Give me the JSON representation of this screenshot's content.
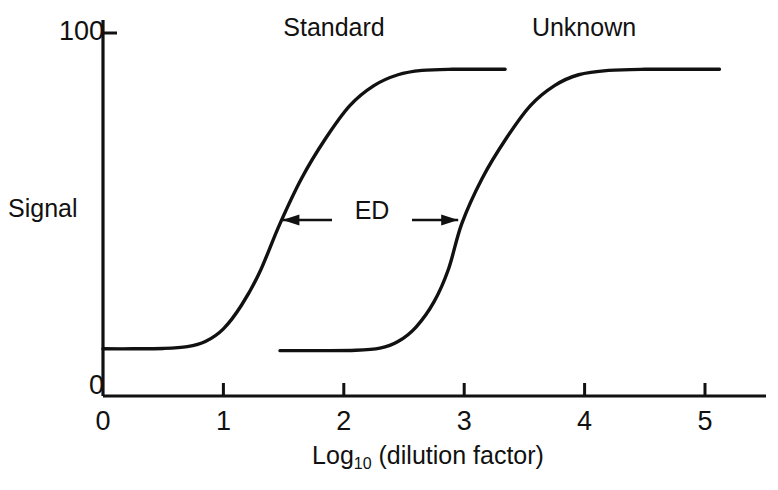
{
  "chart_data": {
    "type": "line",
    "title": "",
    "xlabel": "Log10 (dilution factor)",
    "xlabel_base": "Log",
    "xlabel_sub": "10",
    "xlabel_rest": " (dilution factor)",
    "ylabel": "Signal",
    "xlim": [
      0,
      5
    ],
    "ylim": [
      0,
      100
    ],
    "xticks": [
      0,
      1,
      2,
      3,
      4,
      5
    ],
    "xtick_labels": [
      "0",
      "1",
      "2",
      "3",
      "4",
      "5"
    ],
    "yticks": [
      0,
      100
    ],
    "ytick_labels": [
      "0",
      "100"
    ],
    "grid": false,
    "legend": "inline-labels",
    "series": [
      {
        "name": "Standard",
        "label_x": 2.0,
        "label_y": 96,
        "bottom_plateau": 13,
        "top_plateau": 90,
        "midpoint_x": 1.47,
        "x_start": 0.0,
        "x_end": 3.34,
        "points": [
          {
            "x": 0.0,
            "y": 13.0
          },
          {
            "x": 0.25,
            "y": 13.0
          },
          {
            "x": 0.5,
            "y": 13.1
          },
          {
            "x": 0.7,
            "y": 13.6
          },
          {
            "x": 0.85,
            "y": 15.0
          },
          {
            "x": 1.0,
            "y": 18.5
          },
          {
            "x": 1.15,
            "y": 25.0
          },
          {
            "x": 1.3,
            "y": 34.0
          },
          {
            "x": 1.47,
            "y": 47.5
          },
          {
            "x": 1.65,
            "y": 60.0
          },
          {
            "x": 1.85,
            "y": 71.0
          },
          {
            "x": 2.05,
            "y": 80.0
          },
          {
            "x": 2.25,
            "y": 85.5
          },
          {
            "x": 2.45,
            "y": 88.5
          },
          {
            "x": 2.65,
            "y": 89.7
          },
          {
            "x": 2.9,
            "y": 90.0
          },
          {
            "x": 3.34,
            "y": 90.0
          }
        ]
      },
      {
        "name": "Unknown",
        "label_x": 3.55,
        "label_y": 96,
        "bottom_plateau": 12.5,
        "top_plateau": 90,
        "midpoint_x": 2.98,
        "x_start": 1.47,
        "x_end": 5.12,
        "points": [
          {
            "x": 1.47,
            "y": 12.5
          },
          {
            "x": 1.8,
            "y": 12.5
          },
          {
            "x": 2.1,
            "y": 12.6
          },
          {
            "x": 2.3,
            "y": 13.2
          },
          {
            "x": 2.45,
            "y": 15.0
          },
          {
            "x": 2.6,
            "y": 19.0
          },
          {
            "x": 2.75,
            "y": 26.0
          },
          {
            "x": 2.87,
            "y": 35.0
          },
          {
            "x": 2.98,
            "y": 47.5
          },
          {
            "x": 3.15,
            "y": 60.0
          },
          {
            "x": 3.35,
            "y": 71.0
          },
          {
            "x": 3.55,
            "y": 80.0
          },
          {
            "x": 3.75,
            "y": 85.5
          },
          {
            "x": 3.95,
            "y": 88.5
          },
          {
            "x": 4.2,
            "y": 89.7
          },
          {
            "x": 4.5,
            "y": 90.0
          },
          {
            "x": 5.12,
            "y": 90.0
          }
        ]
      }
    ],
    "annotations": [
      {
        "text": "ED",
        "type": "double-arrow",
        "y": 48.5,
        "x_left": 1.49,
        "x_right": 2.95
      }
    ]
  },
  "axis": {
    "y_top_label": "100",
    "y_zero_label": "0",
    "y_name": "Signal",
    "x_labels": [
      "0",
      "1",
      "2",
      "3",
      "4",
      "5"
    ],
    "x_title_base": "Log",
    "x_title_sub": "10",
    "x_title_rest": "(dilution factor)"
  },
  "labels": {
    "standard": "Standard",
    "unknown": "Unknown",
    "ed": "ED"
  },
  "colors": {
    "ink": "#111111",
    "background": "#ffffff"
  }
}
